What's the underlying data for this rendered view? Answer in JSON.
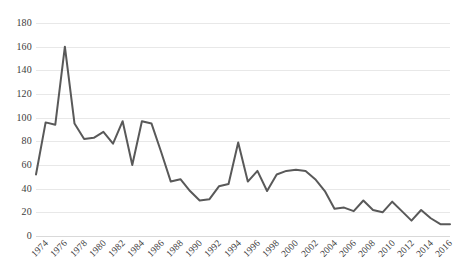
{
  "chart_data": {
    "type": "line",
    "title": "",
    "subtitle": "",
    "xlabel": "",
    "ylabel": "",
    "xlim": [
      1974,
      2017
    ],
    "ylim": [
      0,
      180
    ],
    "grid": true,
    "legend": false,
    "legend_position": "none",
    "y_ticks": [
      0,
      20,
      40,
      60,
      80,
      100,
      120,
      140,
      160,
      180
    ],
    "x_tick_labels": [
      "1974",
      "1976",
      "1978",
      "1980",
      "1982",
      "1984",
      "1986",
      "1988",
      "1990",
      "1992",
      "1994",
      "1996",
      "1998",
      "2000",
      "2002",
      "2004",
      "2006",
      "2008",
      "2010",
      "2012",
      "2014",
      "2016"
    ],
    "x": [
      1974,
      1975,
      1976,
      1977,
      1978,
      1979,
      1980,
      1981,
      1982,
      1983,
      1984,
      1985,
      1986,
      1987,
      1988,
      1989,
      1990,
      1991,
      1992,
      1993,
      1994,
      1995,
      1996,
      1997,
      1998,
      1999,
      2000,
      2001,
      2002,
      2003,
      2004,
      2005,
      2006,
      2007,
      2008,
      2009,
      2010,
      2011,
      2012,
      2013,
      2014,
      2015,
      2016,
      2017
    ],
    "values": [
      52,
      96,
      94,
      160,
      95,
      82,
      83,
      88,
      78,
      97,
      60,
      97,
      95,
      71,
      46,
      48,
      38,
      30,
      31,
      42,
      44,
      79,
      46,
      55,
      38,
      52,
      55,
      56,
      55,
      48,
      38,
      23,
      24,
      21,
      30,
      22,
      20,
      29,
      21,
      13,
      22,
      15,
      10,
      10
    ],
    "series": [
      {
        "name": "series-1",
        "color": "#595959",
        "line_width": 2,
        "markers": false,
        "values": [
          52,
          96,
          94,
          160,
          95,
          82,
          83,
          88,
          78,
          97,
          60,
          97,
          95,
          71,
          46,
          48,
          38,
          30,
          31,
          42,
          44,
          79,
          46,
          55,
          38,
          52,
          55,
          56,
          55,
          48,
          38,
          23,
          24,
          21,
          30,
          22,
          20,
          29,
          21,
          13,
          22,
          15,
          10,
          10
        ]
      }
    ],
    "colors": {
      "line": "#595959",
      "grid": "#e8e8e8",
      "baseline": "#d9d9d9",
      "text": "#3c3c3c",
      "background": "#ffffff"
    }
  }
}
